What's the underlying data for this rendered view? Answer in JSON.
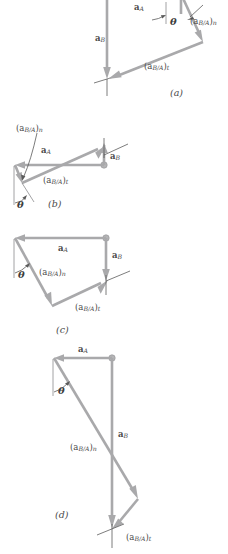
{
  "figure": {
    "colors": {
      "vector": "#a9a9ab",
      "axis": "#5c5c5c",
      "text": "#4a4a4a",
      "background": "#ffffff",
      "joint": "#b4b4b6"
    },
    "symbols": {
      "a_A": "a",
      "a_A_sub": "A",
      "a_B": "a",
      "a_B_sub": "B",
      "rel_open": "(",
      "rel_sym": "a",
      "rel_sub": "B/A",
      "rel_close": ")",
      "comp_n": "n",
      "comp_t": "t",
      "theta": "θ"
    },
    "panels": [
      {
        "id": "a",
        "label": "(a)",
        "vectors": [
          {
            "name": "a_A",
            "label_sym": "a",
            "label_sub": "A",
            "direction": "down"
          },
          {
            "name": "a_B",
            "label_sym": "a",
            "label_sub": "B",
            "direction": "down"
          },
          {
            "name": "a_BA_n",
            "label_sym": "a",
            "label_sub": "B/A",
            "component": "n",
            "direction": "down-right"
          },
          {
            "name": "a_BA_t",
            "label_sym": "a",
            "label_sub": "B/A",
            "component": "t",
            "direction": "down-left"
          }
        ],
        "angle_label": "θ"
      },
      {
        "id": "b",
        "label": "(b)",
        "vectors": [
          {
            "name": "a_A",
            "label_sym": "a",
            "label_sub": "A",
            "direction": "left"
          },
          {
            "name": "a_B",
            "label_sym": "a",
            "label_sub": "B",
            "direction": "up"
          },
          {
            "name": "a_BA_n",
            "label_sym": "a",
            "label_sub": "B/A",
            "component": "n",
            "direction": "down-left"
          },
          {
            "name": "a_BA_t",
            "label_sym": "a",
            "label_sub": "B/A",
            "component": "t",
            "direction": "up-right"
          }
        ],
        "angle_label": "θ"
      },
      {
        "id": "c",
        "label": "(c)",
        "vectors": [
          {
            "name": "a_A",
            "label_sym": "a",
            "label_sub": "A",
            "direction": "left"
          },
          {
            "name": "a_B",
            "label_sym": "a",
            "label_sub": "B",
            "direction": "down"
          },
          {
            "name": "a_BA_n",
            "label_sym": "a",
            "label_sub": "B/A",
            "component": "n",
            "direction": "down-right"
          },
          {
            "name": "a_BA_t",
            "label_sym": "a",
            "label_sub": "B/A",
            "component": "t",
            "direction": "up-right"
          }
        ],
        "angle_label": "θ"
      },
      {
        "id": "d",
        "label": "(d)",
        "vectors": [
          {
            "name": "a_A",
            "label_sym": "a",
            "label_sub": "A",
            "direction": "left"
          },
          {
            "name": "a_B",
            "label_sym": "a",
            "label_sub": "B",
            "direction": "down"
          },
          {
            "name": "a_BA_n",
            "label_sym": "a",
            "label_sub": "B/A",
            "component": "n",
            "direction": "down-right"
          },
          {
            "name": "a_BA_t",
            "label_sym": "a",
            "label_sub": "B/A",
            "component": "t",
            "direction": "down-left"
          }
        ],
        "angle_label": "θ"
      }
    ],
    "labels": {
      "panel_a": "(a)",
      "panel_b": "(b)",
      "panel_c": "(c)",
      "panel_d": "(d)",
      "theta": "θ",
      "aA": "a",
      "aA_sub": "A",
      "aB": "a",
      "aB_sub": "B",
      "rel_prefix": "(a",
      "rel_sub": "B/A",
      "rel_suffix_n": ")",
      "n": "n",
      "t": "t"
    }
  }
}
